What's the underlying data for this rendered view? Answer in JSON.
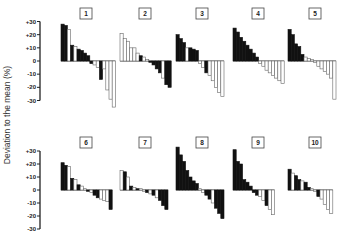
{
  "chart_data": {
    "type": "bar",
    "title": "",
    "ylabel": "Deviation to the mean (%)",
    "xlabel": "",
    "ylim": [
      -30,
      30
    ],
    "yticks": [
      30,
      20,
      10,
      0,
      -10,
      -20,
      -30
    ],
    "ytick_labels": [
      "+30",
      "+20",
      "+10",
      "0",
      "-10",
      "-20",
      "-30"
    ],
    "legend": [
      {
        "name": "dark bars",
        "color": "#111111"
      },
      {
        "name": "open bars",
        "color": "#ffffff"
      }
    ],
    "panels": [
      {
        "label": "1",
        "bars": [
          {
            "v": 28,
            "f": "b"
          },
          {
            "v": 27,
            "f": "b"
          },
          {
            "v": 24,
            "f": "w"
          },
          {
            "v": 12,
            "f": "b"
          },
          {
            "v": 11,
            "f": "w"
          },
          {
            "v": 9,
            "f": "b"
          },
          {
            "v": 8,
            "f": "b"
          },
          {
            "v": 6,
            "f": "b"
          },
          {
            "v": 4,
            "f": "b"
          },
          {
            "v": -2,
            "f": "b"
          },
          {
            "v": -3,
            "f": "w"
          },
          {
            "v": -5,
            "f": "w"
          },
          {
            "v": -14,
            "f": "b"
          },
          {
            "v": -6,
            "f": "w"
          },
          {
            "v": -22,
            "f": "w"
          },
          {
            "v": -29,
            "f": "w"
          },
          {
            "v": -35,
            "f": "w"
          }
        ]
      },
      {
        "label": "2",
        "bars": [
          {
            "v": 21,
            "f": "w"
          },
          {
            "v": 17,
            "f": "w"
          },
          {
            "v": 15,
            "f": "w"
          },
          {
            "v": 10,
            "f": "w"
          },
          {
            "v": 10,
            "f": "w"
          },
          {
            "v": 6,
            "f": "w"
          },
          {
            "v": 4,
            "f": "b"
          },
          {
            "v": 3,
            "f": "w"
          },
          {
            "v": 1,
            "f": "w"
          },
          {
            "v": -1,
            "f": "b"
          },
          {
            "v": -3,
            "f": "b"
          },
          {
            "v": -6,
            "f": "b"
          },
          {
            "v": -9,
            "f": "b"
          },
          {
            "v": -13,
            "f": "w"
          },
          {
            "v": -18,
            "f": "b"
          },
          {
            "v": -20,
            "f": "b"
          }
        ]
      },
      {
        "label": "3",
        "bars": [
          {
            "v": 20,
            "f": "b"
          },
          {
            "v": 17,
            "f": "b"
          },
          {
            "v": 14,
            "f": "b"
          },
          {
            "v": 10,
            "f": "w"
          },
          {
            "v": 10,
            "f": "b"
          },
          {
            "v": 9,
            "f": "b"
          },
          {
            "v": 8,
            "f": "b"
          },
          {
            "v": -2,
            "f": "w"
          },
          {
            "v": -5,
            "f": "w"
          },
          {
            "v": -9,
            "f": "b"
          },
          {
            "v": -11,
            "f": "w"
          },
          {
            "v": -15,
            "f": "w"
          },
          {
            "v": -20,
            "f": "w"
          },
          {
            "v": -24,
            "f": "w"
          },
          {
            "v": -27,
            "f": "w"
          }
        ]
      },
      {
        "label": "4",
        "bars": [
          {
            "v": 25,
            "f": "b"
          },
          {
            "v": 22,
            "f": "b"
          },
          {
            "v": 18,
            "f": "b"
          },
          {
            "v": 15,
            "f": "b"
          },
          {
            "v": 12,
            "f": "b"
          },
          {
            "v": 9,
            "f": "b"
          },
          {
            "v": 6,
            "f": "b"
          },
          {
            "v": 3,
            "f": "b"
          },
          {
            "v": -2,
            "f": "w"
          },
          {
            "v": -4,
            "f": "w"
          },
          {
            "v": -7,
            "f": "w"
          },
          {
            "v": -9,
            "f": "w"
          },
          {
            "v": -11,
            "f": "w"
          },
          {
            "v": -13,
            "f": "w"
          },
          {
            "v": -15,
            "f": "w"
          },
          {
            "v": -17,
            "f": "w"
          }
        ]
      },
      {
        "label": "5",
        "bars": [
          {
            "v": 24,
            "f": "b"
          },
          {
            "v": 20,
            "f": "b"
          },
          {
            "v": 13,
            "f": "b"
          },
          {
            "v": 11,
            "f": "b"
          },
          {
            "v": 5,
            "f": "b"
          },
          {
            "v": 3,
            "f": "w"
          },
          {
            "v": 2,
            "f": "w"
          },
          {
            "v": 1,
            "f": "w"
          },
          {
            "v": -1,
            "f": "w"
          },
          {
            "v": -4,
            "f": "w"
          },
          {
            "v": -6,
            "f": "w"
          },
          {
            "v": -8,
            "f": "w"
          },
          {
            "v": -10,
            "f": "w"
          },
          {
            "v": -13,
            "f": "w"
          },
          {
            "v": -29,
            "f": "w"
          }
        ]
      },
      {
        "label": "6",
        "bars": [
          {
            "v": 21,
            "f": "b"
          },
          {
            "v": 19,
            "f": "b"
          },
          {
            "v": 18,
            "f": "w"
          },
          {
            "v": 9,
            "f": "b"
          },
          {
            "v": 8,
            "f": "w"
          },
          {
            "v": 4,
            "f": "b"
          },
          {
            "v": 3,
            "f": "w"
          },
          {
            "v": 1,
            "f": "w"
          },
          {
            "v": -1,
            "f": "b"
          },
          {
            "v": -2,
            "f": "w"
          },
          {
            "v": -4,
            "f": "b"
          },
          {
            "v": -6,
            "f": "b"
          },
          {
            "v": -7,
            "f": "w"
          },
          {
            "v": -8,
            "f": "w"
          },
          {
            "v": -9,
            "f": "w"
          },
          {
            "v": -15,
            "f": "b"
          }
        ]
      },
      {
        "label": "7",
        "bars": [
          {
            "v": 15,
            "f": "w"
          },
          {
            "v": 14,
            "f": "b"
          },
          {
            "v": 10,
            "f": "w"
          },
          {
            "v": 3,
            "f": "b"
          },
          {
            "v": 2,
            "f": "w"
          },
          {
            "v": 1,
            "f": "b"
          },
          {
            "v": 1,
            "f": "w"
          },
          {
            "v": -1,
            "f": "w"
          },
          {
            "v": -2,
            "f": "b"
          },
          {
            "v": -3,
            "f": "w"
          },
          {
            "v": -4,
            "f": "b"
          },
          {
            "v": -6,
            "f": "w"
          },
          {
            "v": -8,
            "f": "b"
          },
          {
            "v": -12,
            "f": "b"
          },
          {
            "v": -15,
            "f": "b"
          }
        ]
      },
      {
        "label": "8",
        "bars": [
          {
            "v": 33,
            "f": "b"
          },
          {
            "v": 27,
            "f": "b"
          },
          {
            "v": 22,
            "f": "b"
          },
          {
            "v": 15,
            "f": "b"
          },
          {
            "v": 10,
            "f": "b"
          },
          {
            "v": 7,
            "f": "b"
          },
          {
            "v": 5,
            "f": "b"
          },
          {
            "v": 1,
            "f": "w"
          },
          {
            "v": -2,
            "f": "w"
          },
          {
            "v": -4,
            "f": "b"
          },
          {
            "v": -7,
            "f": "b"
          },
          {
            "v": -10,
            "f": "w"
          },
          {
            "v": -14,
            "f": "b"
          },
          {
            "v": -18,
            "f": "b"
          },
          {
            "v": -22,
            "f": "b"
          }
        ]
      },
      {
        "label": "9",
        "bars": [
          {
            "v": 31,
            "f": "b"
          },
          {
            "v": 22,
            "f": "b"
          },
          {
            "v": 20,
            "f": "b"
          },
          {
            "v": 8,
            "f": "b"
          },
          {
            "v": 6,
            "f": "b"
          },
          {
            "v": 3,
            "f": "b"
          },
          {
            "v": -2,
            "f": "b"
          },
          {
            "v": -4,
            "f": "b"
          },
          {
            "v": -5,
            "f": "w"
          },
          {
            "v": -8,
            "f": "w"
          },
          {
            "v": -12,
            "f": "b"
          },
          {
            "v": -15,
            "f": "w"
          },
          {
            "v": -19,
            "f": "w"
          }
        ]
      },
      {
        "label": "10",
        "bars": [
          {
            "v": 16,
            "f": "b"
          },
          {
            "v": 13,
            "f": "w"
          },
          {
            "v": 11,
            "f": "b"
          },
          {
            "v": 8,
            "f": "b"
          },
          {
            "v": 7,
            "f": "w"
          },
          {
            "v": 6,
            "f": "b"
          },
          {
            "v": 2,
            "f": "b"
          },
          {
            "v": 1,
            "f": "w"
          },
          {
            "v": -1,
            "f": "w"
          },
          {
            "v": -5,
            "f": "b"
          },
          {
            "v": -7,
            "f": "w"
          },
          {
            "v": -11,
            "f": "w"
          },
          {
            "v": -15,
            "f": "w"
          },
          {
            "v": -18,
            "f": "w"
          }
        ]
      }
    ]
  }
}
